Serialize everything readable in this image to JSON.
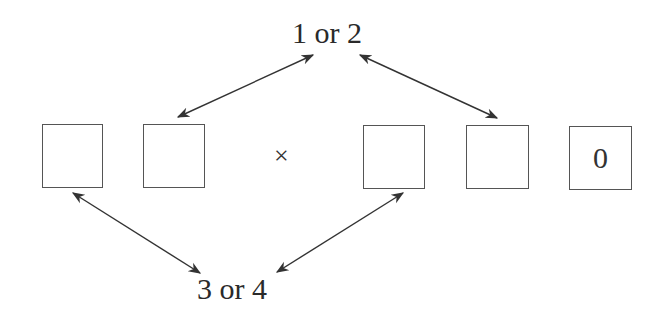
{
  "diagram": {
    "top_label": "1 or 2",
    "bottom_label": "3 or 4",
    "operator": "×",
    "boxes": [
      {
        "id": "box-1",
        "value": ""
      },
      {
        "id": "box-2",
        "value": ""
      },
      {
        "id": "box-3",
        "value": ""
      },
      {
        "id": "box-4",
        "value": ""
      },
      {
        "id": "box-5",
        "value": "0"
      }
    ],
    "arrows": [
      {
        "from": "top_label",
        "to": "box-2",
        "style": "double-headed"
      },
      {
        "from": "top_label",
        "to": "box-4",
        "style": "double-headed"
      },
      {
        "from": "bottom_label",
        "to": "box-1",
        "style": "double-headed"
      },
      {
        "from": "bottom_label",
        "to": "box-3",
        "style": "double-headed"
      }
    ],
    "colors": {
      "line": "#333333",
      "box_border": "#555555",
      "background": "#ffffff"
    }
  }
}
